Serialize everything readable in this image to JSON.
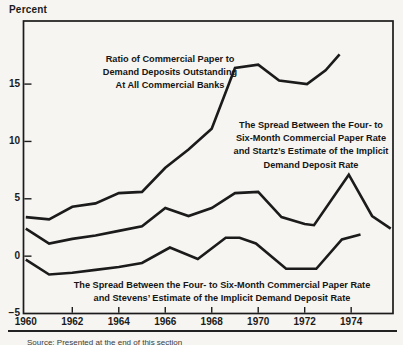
{
  "colors": {
    "ink": "#1b1b1b",
    "paper": "#f6f5f1"
  },
  "y_axis_unit": "Percent",
  "chart_data": {
    "type": "line",
    "title": "",
    "ylabel": "Percent",
    "xlabel": "",
    "grid": false,
    "legend_position": "inline-annotations",
    "x_range": [
      1959.9,
      1975.8
    ],
    "y_range": [
      -5,
      20.5
    ],
    "x_labels": [
      {
        "value": 1960,
        "label": "1960"
      },
      {
        "value": 1962,
        "label": "1962"
      },
      {
        "value": 1964,
        "label": "1964"
      },
      {
        "value": 1966,
        "label": "1966"
      },
      {
        "value": 1968,
        "label": "1968"
      },
      {
        "value": 1970,
        "label": "1970"
      },
      {
        "value": 1972,
        "label": "1972"
      },
      {
        "value": 1974,
        "label": "1974"
      }
    ],
    "x_tick_marks": [
      1962,
      1964,
      1966,
      1968,
      1970,
      1972,
      1974
    ],
    "y_labels": [
      {
        "value": 15,
        "label": "15"
      },
      {
        "value": 10,
        "label": "10"
      },
      {
        "value": 5,
        "label": "5"
      },
      {
        "value": 0,
        "label": "0"
      },
      {
        "value": -5,
        "label": "−5"
      }
    ],
    "y_tick_marks": [
      15,
      10,
      5,
      0
    ],
    "series": [
      {
        "id": "ratio",
        "name": "Ratio of Commercial Paper to Demand Deposits Outstanding At All Commercial Banks",
        "annotation_lines": [
          "Ratio of Commercial Paper to",
          "Demand Deposits Outstanding",
          "At All Commercial Banks"
        ],
        "points": [
          [
            1960,
            3.4
          ],
          [
            1961,
            3.2
          ],
          [
            1962,
            4.3
          ],
          [
            1963,
            4.6
          ],
          [
            1964,
            5.5
          ],
          [
            1965,
            5.6
          ],
          [
            1966,
            7.7
          ],
          [
            1967,
            9.3
          ],
          [
            1968,
            11.1
          ],
          [
            1969,
            16.4
          ],
          [
            1970,
            16.7
          ],
          [
            1970.9,
            15.3
          ],
          [
            1972.1,
            15.0
          ],
          [
            1972.9,
            16.2
          ],
          [
            1973.5,
            17.6
          ]
        ]
      },
      {
        "id": "startz-spread",
        "name": "The Spread Between the Four- to Six-Month Commercial Paper Rate and Startz’s Estimate of the Implicit Demand Deposit Rate",
        "annotation_lines": [
          "The Spread Between the Four- to",
          "Six-Month Commercial Paper Rate",
          "and Startz’s Estimate of the Implicit",
          "Demand Deposit Rate"
        ],
        "points": [
          [
            1960,
            2.4
          ],
          [
            1961,
            1.1
          ],
          [
            1962,
            1.5
          ],
          [
            1963,
            1.8
          ],
          [
            1964,
            2.2
          ],
          [
            1965,
            2.6
          ],
          [
            1966,
            4.2
          ],
          [
            1967,
            3.5
          ],
          [
            1968,
            4.2
          ],
          [
            1969,
            5.5
          ],
          [
            1970,
            5.6
          ],
          [
            1971,
            3.4
          ],
          [
            1972,
            2.8
          ],
          [
            1972.4,
            2.7
          ],
          [
            1973.9,
            7.1
          ],
          [
            1974.9,
            3.5
          ],
          [
            1975.7,
            2.4
          ]
        ]
      },
      {
        "id": "stevens-spread",
        "name": "The Spread Between the Four- to Six-Month Commercial Paper Rate and Stevens’ Estimate of the Implicit Demand Deposit Rate",
        "annotation_lines": [
          "The Spread Between the Four- to Six-Month Commercial Paper Rate",
          "and Stevens’ Estimate of the Implicit Demand Deposit Rate"
        ],
        "points": [
          [
            1960,
            -0.3
          ],
          [
            1961,
            -1.6
          ],
          [
            1962,
            -1.45
          ],
          [
            1963,
            -1.2
          ],
          [
            1964,
            -0.95
          ],
          [
            1965,
            -0.6
          ],
          [
            1966.2,
            0.75
          ],
          [
            1967.4,
            -0.25
          ],
          [
            1968.6,
            1.6
          ],
          [
            1969.2,
            1.6
          ],
          [
            1969.9,
            1.1
          ],
          [
            1971.2,
            -1.1
          ],
          [
            1972.5,
            -1.1
          ],
          [
            1973.6,
            1.45
          ],
          [
            1974.4,
            1.9
          ]
        ]
      }
    ],
    "source_note": "Source: Presented at the end of this section"
  }
}
